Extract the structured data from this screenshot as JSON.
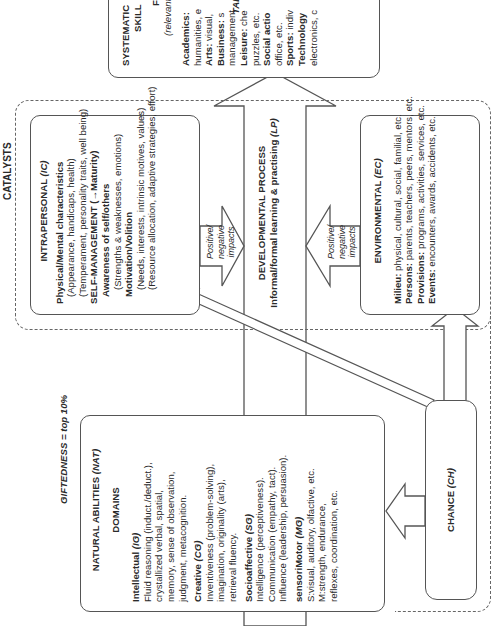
{
  "talent": {
    "heading": "TALE",
    "title_line1": "SYSTEMATIC",
    "title_line2": "SKILL",
    "sub_initial": "F",
    "sub_note": "(relevant t",
    "fields": [
      {
        "label": "Academics:",
        "text": "",
        "detail": "humanities, e"
      },
      {
        "label": "Arts:",
        "text": " visual,",
        "detail": ""
      },
      {
        "label": "Business:",
        "text": " s",
        "detail": "management"
      },
      {
        "label": "Leisure:",
        "text": " che",
        "detail": "puzzles, etc."
      },
      {
        "label": "Social actio",
        "text": "",
        "detail": "office, etc."
      },
      {
        "label": "Sports:",
        "text": " indiv",
        "detail": ""
      },
      {
        "label": "Technology",
        "text": "",
        "detail": "electronics, c"
      }
    ]
  },
  "catalysts": {
    "label": "CATALYSTS",
    "intrapersonal": {
      "title": "INTRAPERSONAL",
      "code": "(IC)",
      "sections": [
        {
          "heading": "Physical/Mental characteristics",
          "lines": [
            "(Appearance, handicaps, health)",
            "(Temperament, personality traits, well being)"
          ]
        },
        {
          "heading": "SELF-MANAGEMENT (→Maturity)",
          "lines": []
        },
        {
          "heading": "Awareness of self/others",
          "lines": [
            "(Strengths & weaknesses, emotions)"
          ]
        },
        {
          "heading": "Motivation/Volition",
          "lines": [
            "(Needs, interests, intrinsic motives, values)",
            "(Resource allocation, adaptive strategies, effort)"
          ]
        }
      ]
    },
    "environmental": {
      "title": "ENVIRONMENTAL",
      "code": "(EC)",
      "items": [
        {
          "label": "Milieu:",
          "text": " physical, cultural, social, familial, etc."
        },
        {
          "label": "Persons:",
          "text": " parents, teachers, peers, mentors, etc."
        },
        {
          "label": "Provisions:",
          "text": " programs, activities, services, etc."
        },
        {
          "label": "Events:",
          "text": " encounters, awards, accidents, etc."
        }
      ]
    },
    "impact_arrow_label": [
      "Positive/",
      "negative",
      "impacts"
    ]
  },
  "developmental_process": {
    "title": "DEVELOPMENTAL PROCESS",
    "subtitle": "Informal/formal learning & practising",
    "code": "(LP)"
  },
  "giftedness": {
    "heading_prefix": "GIFTEDNESS",
    "heading_suffix": " = top 10%",
    "title": "NATURAL ABILITIES",
    "code": "(NAT)",
    "domains_label": "DOMAINS",
    "domains": [
      {
        "name": "Intellectual",
        "code": "(IG)",
        "lines": [
          "Fluid reasoning (induct./deduct.),",
          "crystallized verbal, spatial,",
          "memory, sense of observation,",
          "judgment, metacognition."
        ]
      },
      {
        "name": "Creative",
        "code": "(CG)",
        "lines": [
          "Inventiveness (problem-solving),",
          "imagination, originality (arts),",
          "retrieval fluency."
        ]
      },
      {
        "name": "Socioaffective",
        "code": "(SG)",
        "lines": [
          "Intelligence (perceptiveness).",
          "Communication (empathy, tact).",
          "Influence (leadership, persuasion)."
        ]
      },
      {
        "name": "sensoriMotor",
        "code": "(MG)",
        "lines": [
          "S:visual, auditory, olfactive, etc.",
          "M:strength, endurance,",
          "reflexes, coordination, etc."
        ]
      }
    ]
  },
  "chance": {
    "title": "CHANCE",
    "code": "(CH)"
  },
  "colors": {
    "stroke": "#555555",
    "text": "#2a2a2a",
    "background": "#ffffff"
  }
}
